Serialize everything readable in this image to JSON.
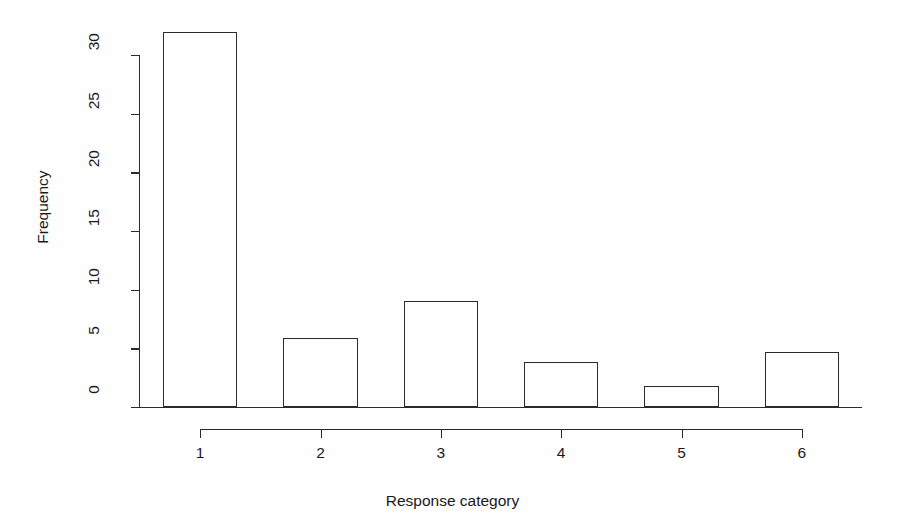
{
  "chart_data": {
    "type": "bar",
    "title": "",
    "subtitle": "",
    "xlabel": "Response category",
    "ylabel": "Frequency",
    "categories": [
      "1",
      "2",
      "3",
      "4",
      "5",
      "6"
    ],
    "values": [
      32,
      5.9,
      9,
      3.8,
      1.8,
      4.7
    ],
    "series": [
      {
        "name": "Frequency",
        "values": [
          32,
          5.9,
          9,
          3.8,
          1.8,
          4.7
        ]
      }
    ],
    "xlim": [
      0.5,
      6.5
    ],
    "ylim": [
      0,
      32
    ],
    "y_ticks": [
      0,
      5,
      10,
      15,
      20,
      25,
      30
    ],
    "y_tick_labels": [
      "0",
      "5",
      "10",
      "15",
      "20",
      "25",
      "30"
    ],
    "x_ticks": [
      1,
      2,
      3,
      4,
      5,
      6
    ],
    "x_tick_labels": [
      "1",
      "2",
      "3",
      "4",
      "5",
      "6"
    ],
    "grid": false,
    "legend": null,
    "bar_fill_color": "#ffffff",
    "bar_border_color": "#2b2b2b",
    "axis_color": "#2b2b2b",
    "background_color": "#fefefe",
    "annotations": []
  },
  "axes": {
    "y_title": "Frequency",
    "x_title": "Response category"
  }
}
